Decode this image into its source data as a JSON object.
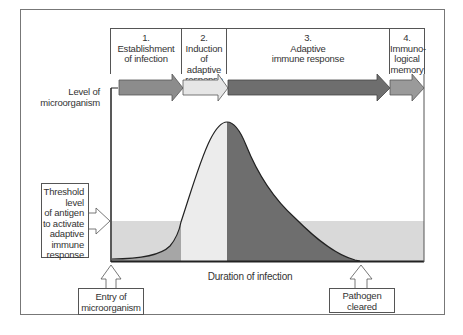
{
  "phases": [
    {
      "number": "1.",
      "lines": [
        "Establishment",
        "of infection"
      ],
      "arrow_color": "#8c8c8c"
    },
    {
      "number": "2.",
      "lines": [
        "Induction",
        "of adaptive",
        "response"
      ],
      "arrow_color": "#e6e6e6"
    },
    {
      "number": "3.",
      "lines": [
        "Adaptive",
        "immune response"
      ],
      "arrow_color": "#6e6e6e"
    },
    {
      "number": "4.",
      "lines": [
        "Immuno-",
        "logical",
        "memory"
      ],
      "arrow_color": "#9a9a9a"
    }
  ],
  "axes": {
    "y_label": [
      "Level of",
      "microorganism"
    ],
    "x_label": "Duration of infection"
  },
  "annotations": {
    "threshold": [
      "Threshold",
      "level",
      "of antigen",
      "to activate",
      "adaptive",
      "immune",
      "response"
    ],
    "entry": [
      "Entry of",
      "microorganism"
    ],
    "cleared": [
      "Pathogen",
      "cleared"
    ]
  },
  "colors": {
    "threshold_band": "#d9d9d9",
    "phase1_fill": "#a6a6a6",
    "phase2_fill": "#ececec",
    "phase3_fill": "#6e6e6e",
    "outline": "#222222"
  }
}
